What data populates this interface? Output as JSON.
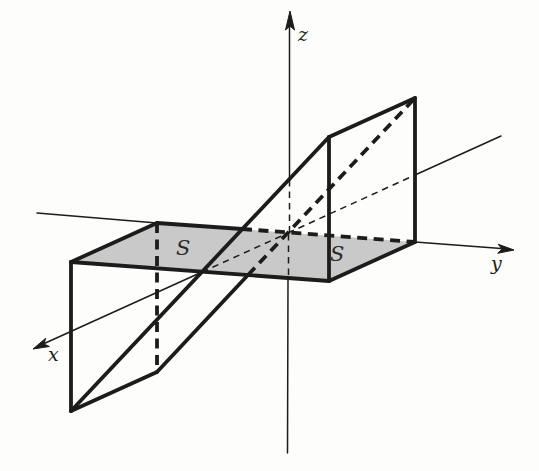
{
  "figure": {
    "description_colors": {
      "ink": "#1c1c1c",
      "region_fill": "#c9c9c9",
      "background": "#fdfdfb"
    },
    "labels": {
      "x": "x",
      "y": "y",
      "z": "z",
      "s_left": "S",
      "s_right": "S"
    },
    "shapes": [
      {
        "kind": "polygon",
        "name": "region-s-strip",
        "cls": "fill-region",
        "points": [
          [
            71,
            262
          ],
          [
            157,
            223
          ],
          [
            415,
            242
          ],
          [
            329,
            281
          ]
        ]
      },
      {
        "kind": "polyline",
        "name": "y-axis-left-segment",
        "cls": "thin",
        "points": [
          [
            37,
            213
          ],
          [
            157,
            223
          ]
        ]
      },
      {
        "kind": "polyline",
        "name": "y-axis-right-segment",
        "cls": "thin",
        "points": [
          [
            415,
            242
          ],
          [
            508,
            249
          ]
        ]
      },
      {
        "kind": "polygon",
        "name": "y-axis-arrowhead",
        "cls": "arrowhead",
        "points": [
          [
            514,
            250
          ],
          [
            497.7,
            253.3
          ],
          [
            502,
            249.1
          ],
          [
            498.3,
            244.3
          ]
        ]
      },
      {
        "kind": "polyline",
        "name": "x-axis-back-segment",
        "cls": "thin",
        "points": [
          [
            415,
            175
          ],
          [
            501,
            136
          ]
        ]
      },
      {
        "kind": "polyline",
        "name": "x-axis-back-hidden-segment",
        "cls": "thin-dashed",
        "points": [
          [
            288,
            233
          ],
          [
            415,
            175
          ]
        ]
      },
      {
        "kind": "polyline",
        "name": "x-axis-front-hidden-segment",
        "cls": "thin-dashed",
        "points": [
          [
            202,
            272
          ],
          [
            288,
            233
          ]
        ]
      },
      {
        "kind": "polyline",
        "name": "x-axis-front-segment",
        "cls": "thin",
        "points": [
          [
            41,
            345
          ],
          [
            202,
            272
          ]
        ]
      },
      {
        "kind": "polygon",
        "name": "x-axis-arrowhead",
        "cls": "arrowhead",
        "points": [
          [
            33,
            349
          ],
          [
            45.7,
            338.3
          ],
          [
            43.9,
            344
          ],
          [
            49.4,
            346.5
          ]
        ]
      },
      {
        "kind": "polyline",
        "name": "z-axis-top-segment",
        "cls": "thin",
        "points": [
          [
            289.5,
            24
          ],
          [
            289.5,
            180
          ]
        ]
      },
      {
        "kind": "polyline",
        "name": "z-axis-upper-hidden-segment",
        "cls": "thin-dashed",
        "points": [
          [
            289.5,
            180
          ],
          [
            289.5,
            232
          ]
        ]
      },
      {
        "kind": "polyline",
        "name": "z-axis-lower-hidden-segment",
        "cls": "thin-dashed",
        "points": [
          [
            288.5,
            234
          ],
          [
            288.5,
            279
          ]
        ]
      },
      {
        "kind": "polyline",
        "name": "z-axis-bottom-segment",
        "cls": "thin",
        "points": [
          [
            288,
            279
          ],
          [
            287.5,
            453
          ]
        ]
      },
      {
        "kind": "polygon",
        "name": "z-axis-arrowhead",
        "cls": "arrowhead",
        "points": [
          [
            290,
            11
          ],
          [
            285.5,
            30
          ],
          [
            290,
            26
          ],
          [
            294.5,
            30
          ]
        ]
      },
      {
        "kind": "polyline",
        "name": "strip-front-edge",
        "cls": "thick",
        "points": [
          [
            71,
            262
          ],
          [
            329,
            281
          ]
        ]
      },
      {
        "kind": "polyline",
        "name": "strip-left-edge",
        "cls": "thick",
        "points": [
          [
            71,
            262
          ],
          [
            157,
            223
          ]
        ]
      },
      {
        "kind": "polyline",
        "name": "strip-back-edge-visible",
        "cls": "thick",
        "points": [
          [
            157,
            223
          ],
          [
            242,
            229
          ]
        ]
      },
      {
        "kind": "polyline",
        "name": "strip-back-edge-hidden",
        "cls": "thick-dashed",
        "points": [
          [
            242,
            229
          ],
          [
            415,
            242
          ]
        ]
      },
      {
        "kind": "polyline",
        "name": "strip-right-edge",
        "cls": "thick",
        "points": [
          [
            329,
            281
          ],
          [
            415,
            242
          ]
        ]
      },
      {
        "kind": "polyline",
        "name": "plane-front-long-edge",
        "cls": "thick",
        "points": [
          [
            71,
            411
          ],
          [
            329,
            137
          ]
        ]
      },
      {
        "kind": "polyline",
        "name": "plane-left-short-edge",
        "cls": "thick",
        "points": [
          [
            71,
            411
          ],
          [
            157,
            372
          ]
        ]
      },
      {
        "kind": "polyline",
        "name": "plane-back-long-edge-visible",
        "cls": "thick",
        "points": [
          [
            157,
            372
          ],
          [
            248,
            275
          ]
        ]
      },
      {
        "kind": "polyline",
        "name": "plane-back-long-edge-hidden",
        "cls": "thick-dashed",
        "points": [
          [
            248,
            275
          ],
          [
            415,
            98
          ]
        ]
      },
      {
        "kind": "polyline",
        "name": "plane-right-short-edge",
        "cls": "thick",
        "points": [
          [
            329,
            137
          ],
          [
            415,
            98
          ]
        ]
      },
      {
        "kind": "polyline",
        "name": "corner-drop-front-left",
        "cls": "thick",
        "points": [
          [
            71,
            262
          ],
          [
            71,
            411
          ]
        ]
      },
      {
        "kind": "polyline",
        "name": "corner-drop-back-left-hidden",
        "cls": "thick-dashed",
        "points": [
          [
            157,
            223
          ],
          [
            157,
            372
          ]
        ]
      },
      {
        "kind": "polyline",
        "name": "corner-drop-front-right",
        "cls": "thick",
        "points": [
          [
            329,
            281
          ],
          [
            329,
            137
          ]
        ]
      },
      {
        "kind": "polyline",
        "name": "corner-drop-back-right",
        "cls": "thick",
        "points": [
          [
            415,
            242
          ],
          [
            415,
            98
          ]
        ]
      },
      {
        "kind": "text",
        "name": "axis-label-z",
        "cls": "axis-label",
        "x": 298,
        "y": 41,
        "bind": "figure.labels.z"
      },
      {
        "kind": "text",
        "name": "axis-label-y",
        "cls": "axis-label",
        "x": 491,
        "y": 270,
        "bind": "figure.labels.y"
      },
      {
        "kind": "text",
        "name": "axis-label-x",
        "cls": "axis-label",
        "x": 48,
        "y": 361,
        "bind": "figure.labels.x"
      },
      {
        "kind": "text",
        "name": "region-label-s-left",
        "cls": "region-label",
        "x": 176,
        "y": 255,
        "bind": "figure.labels.s_left"
      },
      {
        "kind": "text",
        "name": "region-label-s-right",
        "cls": "region-label",
        "x": 330,
        "y": 261,
        "bind": "figure.labels.s_right"
      }
    ]
  }
}
